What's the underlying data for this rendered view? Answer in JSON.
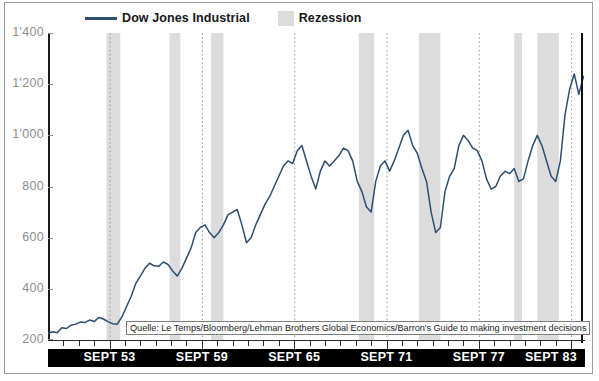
{
  "figure": {
    "clipped_top_text": "",
    "source_note": "Quelle: Le Temps/Bloomberg/Lehman Brothers Global Economics/Barron's Guide to making investment decisions"
  },
  "legend": {
    "series_label": "Dow Jones Industrial",
    "band_label": "Rezession"
  },
  "colors": {
    "line": "#2d4d72",
    "recession_band": "#dcdcdc",
    "gridline": "#9a9a9a",
    "axis": "#1b1b1b",
    "tick_label": "#8d8d8d",
    "band_background": "#000000",
    "band_text": "#ffffff"
  },
  "chart_data": {
    "type": "line",
    "title": "",
    "subtitle": "",
    "xlabel": "",
    "ylabel": "",
    "ylim": [
      200,
      1400
    ],
    "yticks": [
      200,
      400,
      600,
      800,
      1000,
      1200,
      1400
    ],
    "ytick_labels": [
      "200",
      "400",
      "600",
      "800",
      "1'000",
      "1'200",
      "1'400"
    ],
    "xlim": [
      1949.7,
      1984.6
    ],
    "xticks": [
      1953.7,
      1959.7,
      1965.7,
      1971.7,
      1977.7,
      1983.7
    ],
    "xtick_labels": [
      "SEPT 53",
      "SEPT 59",
      "SEPT 65",
      "SEPT 71",
      "SEPT 77",
      "SEPT 83"
    ],
    "grid": "vertical-dotted-at-xticks",
    "legend_position": "top",
    "series": [
      {
        "name": "Dow Jones Industrial",
        "color": "#2d4d72",
        "x": [
          1949.7,
          1950.0,
          1950.3,
          1950.6,
          1950.9,
          1951.2,
          1951.5,
          1951.8,
          1952.1,
          1952.4,
          1952.7,
          1953.0,
          1953.3,
          1953.6,
          1953.9,
          1954.2,
          1954.5,
          1954.8,
          1955.1,
          1955.4,
          1955.7,
          1956.0,
          1956.3,
          1956.6,
          1956.9,
          1957.2,
          1957.5,
          1957.8,
          1958.1,
          1958.4,
          1958.7,
          1959.0,
          1959.3,
          1959.6,
          1959.9,
          1960.2,
          1960.5,
          1960.8,
          1961.1,
          1961.4,
          1961.7,
          1962.0,
          1962.3,
          1962.6,
          1962.9,
          1963.2,
          1963.5,
          1963.8,
          1964.1,
          1964.4,
          1964.7,
          1965.0,
          1965.3,
          1965.6,
          1965.9,
          1966.2,
          1966.5,
          1966.8,
          1967.1,
          1967.4,
          1967.7,
          1968.0,
          1968.3,
          1968.6,
          1968.9,
          1969.2,
          1969.5,
          1969.8,
          1970.1,
          1970.4,
          1970.7,
          1971.0,
          1971.3,
          1971.6,
          1971.9,
          1972.2,
          1972.5,
          1972.8,
          1973.1,
          1973.4,
          1973.7,
          1974.0,
          1974.3,
          1974.6,
          1974.9,
          1975.2,
          1975.5,
          1975.8,
          1976.1,
          1976.4,
          1976.7,
          1977.0,
          1977.3,
          1977.6,
          1977.9,
          1978.2,
          1978.5,
          1978.8,
          1979.1,
          1979.4,
          1979.7,
          1980.0,
          1980.3,
          1980.6,
          1980.9,
          1981.2,
          1981.5,
          1981.8,
          1982.1,
          1982.4,
          1982.7,
          1983.0,
          1983.3,
          1983.6,
          1983.9,
          1984.2,
          1984.5
        ],
        "y": [
          225,
          232,
          228,
          248,
          245,
          258,
          262,
          270,
          268,
          278,
          272,
          288,
          282,
          272,
          264,
          262,
          290,
          330,
          370,
          420,
          450,
          480,
          500,
          490,
          488,
          505,
          495,
          470,
          450,
          480,
          520,
          560,
          620,
          640,
          650,
          620,
          600,
          620,
          650,
          690,
          700,
          710,
          650,
          580,
          600,
          650,
          690,
          730,
          760,
          800,
          840,
          880,
          900,
          890,
          940,
          960,
          900,
          840,
          790,
          860,
          900,
          880,
          900,
          920,
          950,
          940,
          900,
          820,
          780,
          720,
          700,
          820,
          880,
          900,
          860,
          900,
          950,
          1000,
          1020,
          960,
          930,
          870,
          820,
          700,
          620,
          640,
          780,
          840,
          870,
          960,
          1000,
          980,
          950,
          940,
          900,
          830,
          790,
          800,
          840,
          860,
          850,
          870,
          820,
          830,
          900,
          960,
          1000,
          960,
          900,
          840,
          820,
          900,
          1080,
          1180,
          1240,
          1160,
          1230
        ]
      }
    ],
    "recession_bands": [
      {
        "start": 1953.5,
        "end": 1954.4,
        "label": "Rezession"
      },
      {
        "start": 1957.6,
        "end": 1958.3,
        "label": "Rezession"
      },
      {
        "start": 1960.3,
        "end": 1961.1,
        "label": "Rezession"
      },
      {
        "start": 1969.9,
        "end": 1970.9,
        "label": "Rezession"
      },
      {
        "start": 1973.8,
        "end": 1975.2,
        "label": "Rezession"
      },
      {
        "start": 1980.0,
        "end": 1980.5,
        "label": "Rezession"
      },
      {
        "start": 1981.5,
        "end": 1982.9,
        "label": "Rezession"
      }
    ]
  }
}
